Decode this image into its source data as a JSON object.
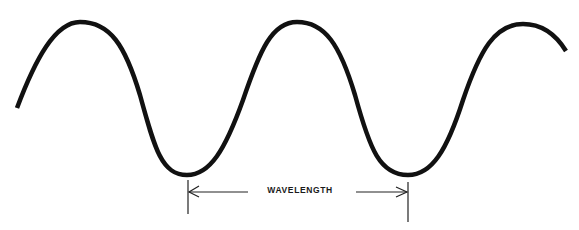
{
  "diagram": {
    "title": "Wavelength",
    "label": "WAVELENGTH",
    "colors": {
      "wave": "#111111",
      "dimension": "#222222",
      "background": "#ffffff"
    },
    "wave": {
      "start": [
        17,
        108
      ],
      "peaks": [
        [
          80,
          22
        ],
        [
          297,
          22
        ],
        [
          523,
          24
        ]
      ],
      "troughs": [
        [
          187,
          175
        ],
        [
          408,
          175
        ]
      ],
      "end": [
        566,
        51
      ],
      "wavelength_px": 221
    },
    "dimension": {
      "left_tick_x": 188,
      "right_tick_x": 408,
      "arrow_y": 192
    }
  }
}
